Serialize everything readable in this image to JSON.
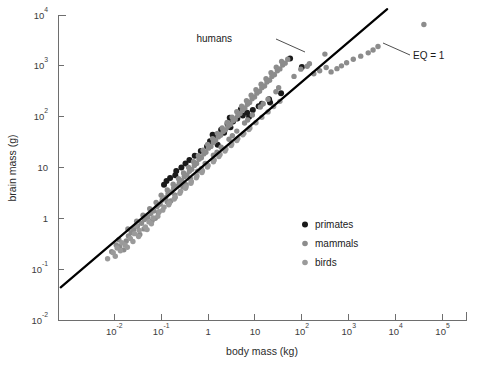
{
  "figure": {
    "background": "#ffffff",
    "plot_area": {
      "x0": 58,
      "y0": 15,
      "x1": 466,
      "y1": 320
    }
  },
  "colors": {
    "primates": "#1a1a1a",
    "mammals": "#8c8c8c",
    "birds": "#9a9a9a",
    "line": "#000000",
    "axis": "#6e6e6e",
    "text": "#2b2b2b"
  },
  "annotations": [
    {
      "name": "humans",
      "text": "humans",
      "text_x": 232,
      "text_y": 42,
      "leader": [
        [
          276,
          39
        ],
        [
          305,
          52
        ]
      ]
    },
    {
      "name": "eq-one",
      "text": "EQ = 1",
      "text_x": 413,
      "text_y": 59,
      "leader": [
        [
          410,
          55
        ],
        [
          383,
          43
        ]
      ]
    }
  ],
  "legend": {
    "x": 305,
    "y": 228,
    "row_gap": 19,
    "items": [
      {
        "label": "primates",
        "color": "#1a1a1a",
        "radius": 3.0
      },
      {
        "label": "mammals",
        "color": "#8c8c8c",
        "radius": 2.8
      },
      {
        "label": "birds",
        "color": "#9a9a9a",
        "radius": 2.8
      }
    ]
  },
  "chart_data": {
    "type": "scatter",
    "title": "",
    "subtitle": "",
    "xlabel": "body mass (kg)",
    "ylabel": "brain mass (g)",
    "xscale": "log",
    "yscale": "log",
    "xlim": [
      0.000631,
      316228.0
    ],
    "ylim": [
      0.01,
      10000.0
    ],
    "grid": false,
    "legend_position": "inside-lower-right",
    "xticks": [
      {
        "value": 0.01,
        "label": "10",
        "exponent": "-2"
      },
      {
        "value": 0.1,
        "label": "10",
        "exponent": "-1"
      },
      {
        "value": 1,
        "label": "1",
        "exponent": ""
      },
      {
        "value": 10,
        "label": "10",
        "exponent": ""
      },
      {
        "value": 100,
        "label": "10",
        "exponent": "2"
      },
      {
        "value": 1000,
        "label": "10",
        "exponent": "3"
      },
      {
        "value": 10000,
        "label": "10",
        "exponent": "4"
      },
      {
        "value": 100000,
        "label": "10",
        "exponent": "5"
      }
    ],
    "yticks": [
      {
        "value": 10000,
        "label": "10",
        "exponent": "4"
      },
      {
        "value": 1000,
        "label": "10",
        "exponent": "3"
      },
      {
        "value": 100,
        "label": "10",
        "exponent": "2"
      },
      {
        "value": 10,
        "label": "10",
        "exponent": ""
      },
      {
        "value": 1,
        "label": "1",
        "exponent": ""
      },
      {
        "value": 0.1,
        "label": "10",
        "exponent": "-1"
      },
      {
        "value": 0.01,
        "label": "10",
        "exponent": "-2"
      }
    ],
    "fit_line": {
      "name": "EQ = 1",
      "description": "allometric reference line, brain mass proportional to body mass^0.75",
      "x_start": 0.00072,
      "y_start": 0.044,
      "x_end": 6600.0,
      "y_end": 13000.0
    },
    "series": [
      {
        "name": "primates",
        "color": "#1a1a1a",
        "points": [
          [
            56,
            1400
          ],
          [
            100,
            950
          ],
          [
            36,
            290
          ],
          [
            20,
            220
          ],
          [
            21,
            190
          ],
          [
            12,
            160
          ],
          [
            9.0,
            135
          ],
          [
            6.8,
            120
          ],
          [
            5.5,
            105
          ],
          [
            7.5,
            100
          ],
          [
            4.2,
            92
          ],
          [
            3.4,
            80
          ],
          [
            2.6,
            72
          ],
          [
            3.0,
            62
          ],
          [
            1.9,
            55
          ],
          [
            2.2,
            48
          ],
          [
            1.4,
            38
          ],
          [
            1.1,
            33
          ],
          [
            0.95,
            26
          ],
          [
            1.6,
            28
          ],
          [
            0.7,
            21
          ],
          [
            0.52,
            17
          ],
          [
            0.4,
            14
          ],
          [
            0.33,
            12
          ],
          [
            0.27,
            10
          ],
          [
            0.21,
            8.5
          ],
          [
            0.2,
            7.0
          ],
          [
            0.155,
            6.2
          ],
          [
            0.13,
            5.4
          ],
          [
            0.115,
            4.6
          ],
          [
            5.0,
            140
          ],
          [
            2.9,
            95
          ],
          [
            14,
            180
          ],
          [
            1.25,
            44
          ]
        ]
      },
      {
        "name": "mammals",
        "color": "#8c8c8c",
        "points": [
          [
            0.0088,
            0.22
          ],
          [
            0.011,
            0.3
          ],
          [
            0.013,
            0.28
          ],
          [
            0.0125,
            0.38
          ],
          [
            0.018,
            0.36
          ],
          [
            0.02,
            0.45
          ],
          [
            0.023,
            0.52
          ],
          [
            0.0195,
            0.62
          ],
          [
            0.026,
            0.6
          ],
          [
            0.031,
            0.7
          ],
          [
            0.03,
            0.88
          ],
          [
            0.038,
            0.8
          ],
          [
            0.044,
            0.95
          ],
          [
            0.041,
            1.15
          ],
          [
            0.052,
            1.05
          ],
          [
            0.06,
            1.25
          ],
          [
            0.057,
            1.55
          ],
          [
            0.07,
            1.4
          ],
          [
            0.082,
            1.7
          ],
          [
            0.078,
            2.05
          ],
          [
            0.095,
            1.9
          ],
          [
            0.105,
            2.3
          ],
          [
            0.1,
            2.85
          ],
          [
            0.125,
            2.55
          ],
          [
            0.14,
            3.05
          ],
          [
            0.135,
            3.6
          ],
          [
            0.165,
            3.3
          ],
          [
            0.185,
            3.95
          ],
          [
            0.18,
            4.7
          ],
          [
            0.215,
            4.3
          ],
          [
            0.245,
            5.1
          ],
          [
            0.235,
            6.0
          ],
          [
            0.275,
            5.5
          ],
          [
            0.31,
            6.6
          ],
          [
            0.3,
            7.8
          ],
          [
            0.355,
            7.1
          ],
          [
            0.4,
            8.4
          ],
          [
            0.385,
            10.0
          ],
          [
            0.45,
            9.2
          ],
          [
            0.51,
            11.0
          ],
          [
            0.49,
            13.0
          ],
          [
            0.57,
            12.0
          ],
          [
            0.64,
            14.5
          ],
          [
            0.62,
            17.0
          ],
          [
            0.72,
            15.5
          ],
          [
            0.81,
            18.5
          ],
          [
            0.78,
            22.0
          ],
          [
            0.9,
            20.0
          ],
          [
            1.02,
            24.0
          ],
          [
            0.98,
            28.5
          ],
          [
            1.15,
            26.0
          ],
          [
            1.3,
            31.0
          ],
          [
            1.25,
            37.0
          ],
          [
            1.45,
            34.0
          ],
          [
            1.65,
            40.0
          ],
          [
            1.58,
            47.0
          ],
          [
            1.85,
            43.0
          ],
          [
            2.1,
            51.0
          ],
          [
            2.0,
            60.0
          ],
          [
            2.35,
            55.0
          ],
          [
            2.65,
            65.0
          ],
          [
            2.55,
            77.0
          ],
          [
            3.0,
            70.0
          ],
          [
            3.4,
            83.0
          ],
          [
            3.25,
            98.0
          ],
          [
            3.8,
            90.0
          ],
          [
            4.3,
            105.0
          ],
          [
            4.1,
            125.0
          ],
          [
            4.8,
            115.0
          ],
          [
            5.4,
            135.0
          ],
          [
            5.2,
            160.0
          ],
          [
            6.1,
            148.0
          ],
          [
            6.9,
            175.0
          ],
          [
            6.6,
            205.0
          ],
          [
            7.7,
            190.0
          ],
          [
            8.7,
            225.0
          ],
          [
            8.3,
            265.0
          ],
          [
            9.8,
            245.0
          ],
          [
            11.0,
            290.0
          ],
          [
            10.5,
            340.0
          ],
          [
            12.5,
            315.0
          ],
          [
            14.0,
            370.0
          ],
          [
            13.5,
            435.0
          ],
          [
            16.0,
            400.0
          ],
          [
            18.0,
            480.0
          ],
          [
            17.2,
            560.0
          ],
          [
            20.5,
            520.0
          ],
          [
            23.0,
            620.0
          ],
          [
            22.0,
            730.0
          ],
          [
            26.0,
            670.0
          ],
          [
            30.0,
            800.0
          ],
          [
            28.5,
            940.0
          ],
          [
            34.0,
            870.0
          ],
          [
            39.0,
            1040.0
          ],
          [
            37.0,
            1220.0
          ],
          [
            44.0,
            1130.0
          ],
          [
            50.0,
            1350.0
          ],
          [
            95.0,
            860.0
          ],
          [
            130.0,
            980.0
          ],
          [
            180.0,
            700.0
          ],
          [
            240.0,
            800.0
          ],
          [
            330.0,
            930.0
          ],
          [
            420.0,
            760.0
          ],
          [
            560.0,
            880.0
          ],
          [
            700.0,
            1000.0
          ],
          [
            900.0,
            1150.0
          ],
          [
            1250.0,
            1350.0
          ],
          [
            1800.0,
            1550.0
          ],
          [
            2600.0,
            1800.0
          ],
          [
            3300.0,
            2050.0
          ],
          [
            4200.0,
            2400.0
          ],
          [
            40000.0,
            6500.0
          ],
          [
            0.043,
            0.62
          ],
          [
            0.064,
            0.9
          ],
          [
            0.088,
            1.3
          ],
          [
            0.135,
            2.1
          ],
          [
            0.195,
            2.9
          ],
          [
            0.29,
            4.2
          ],
          [
            0.42,
            6.0
          ],
          [
            0.6,
            8.5
          ],
          [
            0.87,
            12.0
          ],
          [
            1.3,
            17.5
          ],
          [
            1.9,
            25.0
          ],
          [
            2.8,
            36.0
          ],
          [
            4.1,
            52.0
          ],
          [
            6.0,
            75.0
          ],
          [
            8.8,
            108.0
          ],
          [
            13.0,
            155.0
          ],
          [
            19.0,
            220.0
          ],
          [
            28.0,
            310.0
          ],
          [
            0.016,
            0.24
          ],
          [
            0.035,
            0.48
          ],
          [
            0.075,
            1.0
          ],
          [
            0.16,
            2.2
          ],
          [
            0.34,
            4.6
          ],
          [
            0.72,
            9.5
          ],
          [
            1.55,
            20.0
          ],
          [
            3.3,
            42.0
          ],
          [
            7.0,
            86.0
          ],
          [
            15.0,
            180.0
          ],
          [
            32.0,
            370.0
          ],
          [
            68.0,
            620.0
          ],
          [
            145.0,
            1100.0
          ],
          [
            310.0,
            1700.0
          ]
        ]
      },
      {
        "name": "birds",
        "color": "#9a9a9a",
        "points": [
          [
            0.0072,
            0.16
          ],
          [
            0.0095,
            0.21
          ],
          [
            0.0115,
            0.26
          ],
          [
            0.0145,
            0.33
          ],
          [
            0.017,
            0.3
          ],
          [
            0.022,
            0.4
          ],
          [
            0.027,
            0.5
          ],
          [
            0.034,
            0.58
          ],
          [
            0.029,
            0.72
          ],
          [
            0.046,
            0.68
          ],
          [
            0.055,
            0.85
          ],
          [
            0.068,
            1.02
          ],
          [
            0.09,
            1.35
          ],
          [
            0.115,
            1.65
          ],
          [
            0.15,
            2.0
          ],
          [
            0.2,
            2.6
          ],
          [
            0.26,
            3.4
          ],
          [
            0.34,
            4.2
          ],
          [
            0.44,
            5.3
          ],
          [
            0.58,
            6.8
          ],
          [
            0.76,
            8.6
          ],
          [
            1.0,
            11.0
          ],
          [
            1.35,
            14.0
          ],
          [
            1.8,
            18.0
          ],
          [
            2.4,
            23.0
          ],
          [
            3.2,
            29.0
          ],
          [
            4.3,
            37.0
          ],
          [
            5.8,
            47.0
          ],
          [
            7.8,
            60.0
          ],
          [
            10.5,
            76.0
          ],
          [
            14.0,
            97.0
          ],
          [
            19.0,
            124.0
          ],
          [
            25.0,
            158.0
          ],
          [
            34.0,
            200.0
          ],
          [
            0.0105,
            0.18
          ],
          [
            0.0135,
            0.23
          ],
          [
            0.019,
            0.27
          ],
          [
            0.025,
            0.35
          ],
          [
            0.033,
            0.44
          ],
          [
            0.05,
            0.6
          ],
          [
            0.062,
            0.78
          ],
          [
            0.085,
            1.1
          ],
          [
            0.108,
            1.45
          ],
          [
            0.145,
            1.85
          ],
          [
            0.19,
            2.4
          ],
          [
            0.25,
            3.1
          ],
          [
            0.33,
            3.9
          ],
          [
            0.43,
            4.9
          ],
          [
            0.56,
            6.3
          ],
          [
            0.74,
            8.0
          ],
          [
            0.97,
            10.2
          ],
          [
            1.3,
            13.0
          ],
          [
            1.7,
            16.5
          ],
          [
            2.3,
            21.0
          ],
          [
            3.1,
            27.0
          ],
          [
            4.1,
            34.0
          ],
          [
            5.5,
            44.0
          ],
          [
            7.4,
            56.0
          ]
        ]
      }
    ]
  }
}
